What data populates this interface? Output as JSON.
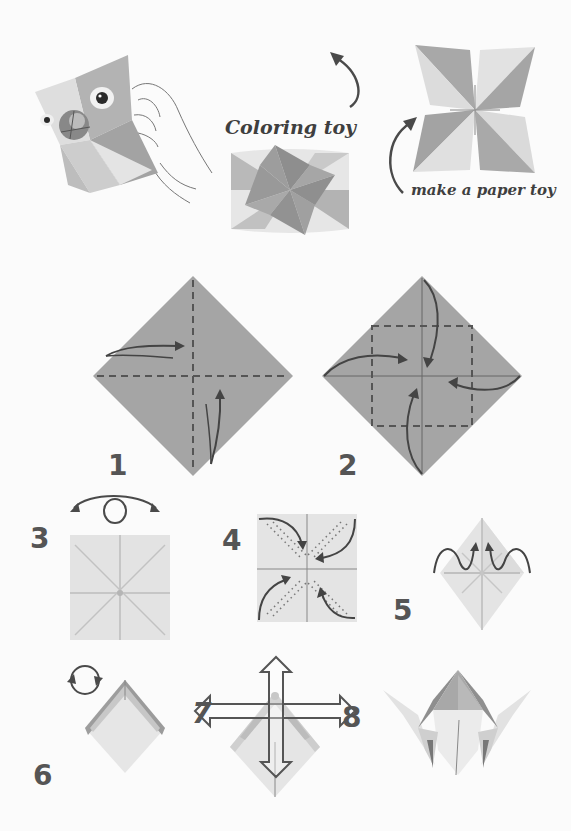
{
  "page": {
    "background": "#fbfbfb"
  },
  "header": {
    "label_coloring": "Coloring toy",
    "label_make": "make a paper toy"
  },
  "illustrations": {
    "hero_bird": "bird-faced paper fortune teller held by hand",
    "coloring_toy": "folded fortune teller (top view, star pattern)",
    "finished_toy": "fortune teller open pinwheel shape"
  },
  "steps": [
    {
      "number": "1",
      "description": "Fold square in half both ways along dashed lines"
    },
    {
      "number": "2",
      "description": "Fold four corners to the center"
    },
    {
      "number": "3",
      "description": "Turn over"
    },
    {
      "number": "4",
      "description": "Fold corners to center again"
    },
    {
      "number": "5",
      "description": "Fold in half"
    },
    {
      "number": "6",
      "description": "Rotate"
    },
    {
      "number": "7",
      "description": "Insert fingers and push outward"
    },
    {
      "number": "8",
      "description": "Finished fortune teller"
    }
  ],
  "colors": {
    "paper_dark": "#9b9b9b",
    "paper_mid": "#b4b4b4",
    "paper_light": "#dcdcdc",
    "paper_lighter": "#e9e9e9",
    "ink": "#4a4a4a",
    "number": "#555555"
  }
}
